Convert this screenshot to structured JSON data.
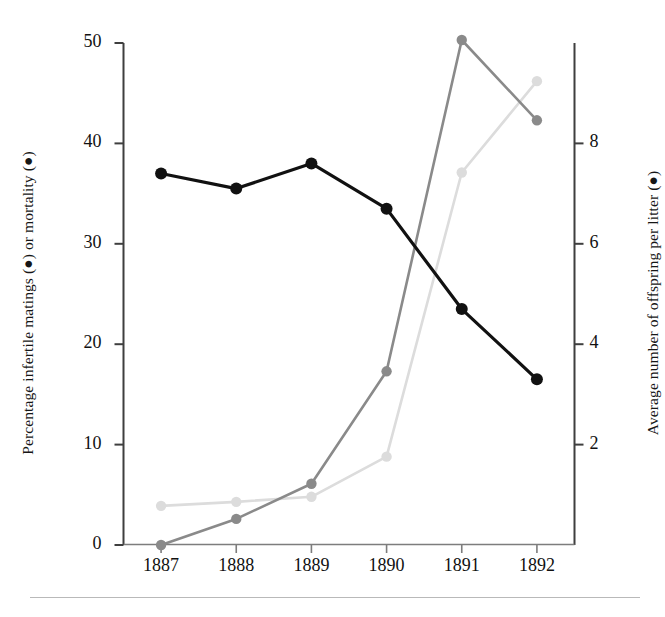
{
  "figure": {
    "bottom_rule": true,
    "background": "#ffffff"
  },
  "chart_data": {
    "type": "line",
    "title": "",
    "xlabel": "",
    "ylabel": "Percentage infertile matings (●) or mortality (●)",
    "y2label": "Average number of offspring per litter (●)",
    "categories": [
      "1887",
      "1888",
      "1889",
      "1890",
      "1891",
      "1892"
    ],
    "x": [
      1887,
      1888,
      1889,
      1890,
      1891,
      1892
    ],
    "ylim": [
      0,
      50
    ],
    "yticks": [
      0,
      10,
      20,
      30,
      40,
      50
    ],
    "ytick_labels": [
      "0",
      "10",
      "20",
      "30",
      "40",
      "50"
    ],
    "y2lim": [
      0,
      10
    ],
    "y2ticks": [
      2,
      4,
      6,
      8
    ],
    "y2tick_labels": [
      "2",
      "4",
      "6",
      "8"
    ],
    "grid": false,
    "legend_position": "none",
    "series": [
      {
        "name": "Average number of offspring per litter",
        "axis": "right",
        "marker": "filled-circle",
        "color": "#111111",
        "linewidth": 3.2,
        "values": [
          7.4,
          7.1,
          7.6,
          6.7,
          4.7,
          3.3
        ],
        "left_scale_equivalent": [
          37.1,
          35.6,
          38.0,
          33.6,
          23.4,
          16.3
        ]
      },
      {
        "name": "Percentage infertile matings",
        "axis": "left",
        "marker": "filled-circle",
        "color": "#8a8a8a",
        "linewidth": 2.6,
        "values": [
          0.0,
          2.6,
          6.1,
          17.3,
          50.3,
          42.3
        ]
      },
      {
        "name": "Percentage mortality",
        "axis": "left",
        "marker": "filled-circle",
        "color": "#dcdcdc",
        "linewidth": 2.6,
        "values": [
          3.9,
          4.3,
          4.8,
          8.8,
          37.1,
          46.2
        ]
      }
    ],
    "colors": {
      "offspring": "#111111",
      "infertile_matings": "#8a8a8a",
      "mortality": "#dcdcdc",
      "axis": "#444444"
    }
  },
  "axes": {
    "left": {
      "label": "Percentage infertile matings (●) or mortality (●)",
      "ticks": [
        "50",
        "40",
        "30",
        "20",
        "10",
        "0"
      ]
    },
    "right": {
      "label": "Average number of offspring per litter (●)",
      "ticks": [
        "8",
        "6",
        "4",
        "2"
      ]
    },
    "bottom": {
      "ticks": [
        "1887",
        "1888",
        "1889",
        "1890",
        "1891",
        "1892"
      ]
    }
  }
}
